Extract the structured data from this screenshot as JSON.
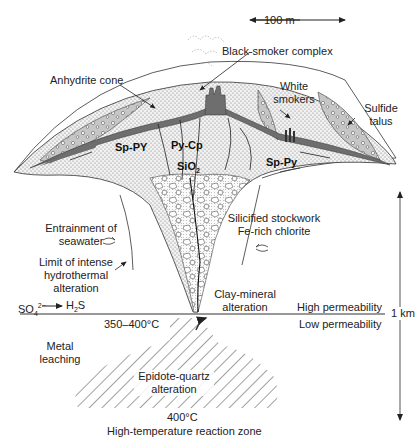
{
  "figure": {
    "scale_horizontal": "100 m",
    "scale_vertical": "1 km",
    "colors": {
      "line": "#333333",
      "sulfide_dark": "#6e6e6e",
      "anhydrite_light": "#c8c8c8",
      "stipple_bg": "#eeeeee",
      "background": "#ffffff"
    }
  },
  "labels": {
    "black_smoker": "Black-smoker complex",
    "anhydrite_cone": "Anhydrite cone",
    "white_smokers_1": "White",
    "white_smokers_2": "smokers",
    "sulfide_talus_1": "Sulfide",
    "sulfide_talus_2": "talus",
    "sp_py_left": "Sp-PY",
    "py_cp": "Py-Cp",
    "sio2": "SiO",
    "sio2_sub": "2",
    "sp_py_right": "Sp-Py",
    "entrainment_1": "Entrainment of",
    "entrainment_2": "seawater",
    "limit_1": "Limit of intense",
    "limit_2": "hydrothermal",
    "limit_3": "alteration",
    "silicified_1": "Silicified stockwork",
    "silicified_2": "Fe-rich chlorite",
    "clay_1": "Clay-mineral",
    "clay_2": "alteration",
    "so4": "SO",
    "so4_sub": "4",
    "so4_sup": "2−",
    "h2s": "H",
    "h2s_sub": "2",
    "h2s_tail": "S",
    "high_perm": "High permeability",
    "low_perm": "Low permeability",
    "temp_350_400": "350–400°C",
    "metal_1": "Metal",
    "metal_2": "leaching",
    "epidote_1": "Epidote-quartz",
    "epidote_2": "alteration",
    "temp_400": "400°C",
    "reaction_zone": "High-temperature reaction zone"
  }
}
